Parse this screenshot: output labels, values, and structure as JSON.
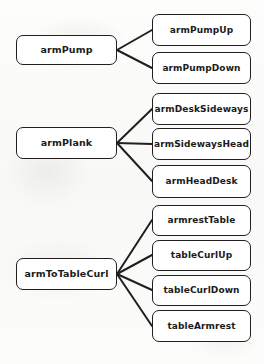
{
  "diagram": {
    "type": "node-link-hierarchy",
    "title": "",
    "background_color": "#fbfbfa",
    "node_fill": "#ffffff",
    "node_stroke": "#231f20",
    "edge_color": "#231f20",
    "parents": [
      {
        "id": "armPump",
        "label": "armPump",
        "x": 16,
        "y": 35,
        "w": 101,
        "h": 30,
        "children": [
          "armPumpUp",
          "armPumpDown"
        ]
      },
      {
        "id": "armPlank",
        "label": "armPlank",
        "x": 16,
        "y": 127,
        "w": 101,
        "h": 32,
        "children": [
          "armDeskSideways",
          "armSidewaysHead",
          "armHeadDesk"
        ]
      },
      {
        "id": "armToTableCurl",
        "label": "armToTableCurl",
        "x": 16,
        "y": 258,
        "w": 101,
        "h": 32,
        "children": [
          "armrestTable",
          "tableCurlUp",
          "tableCurlDown",
          "tableArmrest"
        ]
      }
    ],
    "children": [
      {
        "id": "armPumpUp",
        "label": "armPumpUp",
        "x": 152,
        "y": 14,
        "w": 99,
        "h": 32
      },
      {
        "id": "armPumpDown",
        "label": "armPumpDown",
        "x": 152,
        "y": 52,
        "w": 99,
        "h": 32
      },
      {
        "id": "armDeskSideways",
        "label": "armDeskSideways",
        "x": 152,
        "y": 93,
        "w": 99,
        "h": 32
      },
      {
        "id": "armSidewaysHead",
        "label": "armSidewaysHead",
        "x": 152,
        "y": 128,
        "w": 99,
        "h": 32
      },
      {
        "id": "armHeadDesk",
        "label": "armHeadDesk",
        "x": 152,
        "y": 165,
        "w": 99,
        "h": 33
      },
      {
        "id": "armrestTable",
        "label": "armrestTable",
        "x": 152,
        "y": 205,
        "w": 99,
        "h": 31
      },
      {
        "id": "tableCurlUp",
        "label": "tableCurlUp",
        "x": 152,
        "y": 240,
        "w": 99,
        "h": 31
      },
      {
        "id": "tableCurlDown",
        "label": "tableCurlDown",
        "x": 152,
        "y": 275,
        "w": 99,
        "h": 31
      },
      {
        "id": "tableArmrest",
        "label": "tableArmrest",
        "x": 152,
        "y": 310,
        "w": 99,
        "h": 32
      }
    ],
    "edges": [
      {
        "from": "armPump",
        "to": "armPumpUp",
        "x1": 117,
        "y1": 50,
        "x2": 152,
        "y2": 30
      },
      {
        "from": "armPump",
        "to": "armPumpDown",
        "x1": 117,
        "y1": 50,
        "x2": 152,
        "y2": 68
      },
      {
        "from": "armPlank",
        "to": "armDeskSideways",
        "x1": 117,
        "y1": 143,
        "x2": 152,
        "y2": 109
      },
      {
        "from": "armPlank",
        "to": "armSidewaysHead",
        "x1": 117,
        "y1": 143,
        "x2": 152,
        "y2": 144
      },
      {
        "from": "armPlank",
        "to": "armHeadDesk",
        "x1": 117,
        "y1": 143,
        "x2": 152,
        "y2": 181
      },
      {
        "from": "armToTableCurl",
        "to": "armrestTable",
        "x1": 117,
        "y1": 274,
        "x2": 152,
        "y2": 220
      },
      {
        "from": "armToTableCurl",
        "to": "tableCurlUp",
        "x1": 117,
        "y1": 274,
        "x2": 152,
        "y2": 255
      },
      {
        "from": "armToTableCurl",
        "to": "tableCurlDown",
        "x1": 117,
        "y1": 274,
        "x2": 152,
        "y2": 290
      },
      {
        "from": "armToTableCurl",
        "to": "tableArmrest",
        "x1": 117,
        "y1": 274,
        "x2": 152,
        "y2": 326
      }
    ]
  }
}
